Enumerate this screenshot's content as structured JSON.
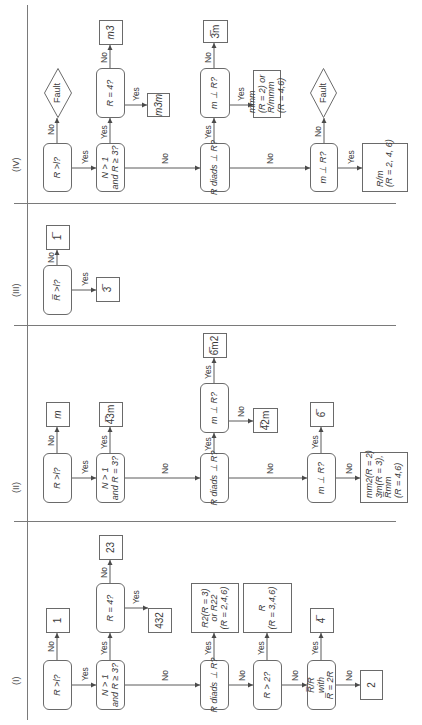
{
  "figure": {
    "sections": [
      {
        "id": "I",
        "label": "(I)",
        "u": 40,
        "v": 11
      },
      {
        "id": "II",
        "label": "(II)",
        "u": 232,
        "v": 11
      },
      {
        "id": "III",
        "label": "(III)",
        "u": 428,
        "v": 11
      },
      {
        "id": "IV",
        "label": "(IV)",
        "u": 553,
        "v": 11
      }
    ],
    "rules": [
      {
        "name": "main-flow-line",
        "u": 5,
        "v": 27,
        "w": 715,
        "h": 1
      },
      {
        "name": "divider-i-ii",
        "u": 203,
        "v": 14,
        "w": 1,
        "h": 382
      },
      {
        "name": "divider-ii-iii",
        "u": 399,
        "v": 14,
        "w": 1,
        "h": 382
      },
      {
        "name": "divider-iii-iv",
        "u": 521,
        "v": 14,
        "w": 1,
        "h": 382
      }
    ],
    "nodes": [
      {
        "id": "i_q1",
        "section": "I",
        "shape": "rounded",
        "u": 15,
        "v": 43,
        "w": 50,
        "h": 29,
        "lines": [
          "R >l?"
        ],
        "italic": true
      },
      {
        "id": "i_r1",
        "section": "I",
        "shape": "rect",
        "u": 92,
        "v": 46,
        "w": 25,
        "h": 24,
        "lines": [
          "1"
        ]
      },
      {
        "id": "i_q2",
        "section": "I",
        "shape": "rounded",
        "u": 15,
        "v": 96,
        "w": 50,
        "h": 29,
        "lines": [
          "N > 1",
          "and R ≥ 3?"
        ],
        "italic": true
      },
      {
        "id": "i_q3",
        "section": "I",
        "shape": "rounded",
        "u": 92,
        "v": 96,
        "w": 50,
        "h": 29,
        "lines": [
          "R = 4?"
        ],
        "italic": true
      },
      {
        "id": "i_r23",
        "section": "I",
        "shape": "rect",
        "u": 165,
        "v": 99,
        "w": 25,
        "h": 24,
        "lines": [
          "23"
        ]
      },
      {
        "id": "i_r432",
        "section": "I",
        "shape": "rect",
        "u": 92,
        "v": 148,
        "w": 25,
        "h": 24,
        "lines": [
          "432"
        ]
      },
      {
        "id": "i_q4",
        "section": "I",
        "shape": "rounded",
        "u": 15,
        "v": 200,
        "w": 50,
        "h": 29,
        "lines": [
          "R diads ⊥ R?"
        ],
        "italic": true
      },
      {
        "id": "i_rR2",
        "section": "I",
        "shape": "rect",
        "u": 92,
        "v": 191,
        "w": 50,
        "h": 48,
        "lines": [
          "R2(R = 3)",
          "or R22",
          "(R = 2,4,6)"
        ],
        "italic": true
      },
      {
        "id": "i_q5",
        "section": "I",
        "shape": "rounded",
        "u": 15,
        "v": 253,
        "w": 50,
        "h": 29,
        "lines": [
          "R > 2?"
        ],
        "italic": true
      },
      {
        "id": "i_rR",
        "section": "I",
        "shape": "rect",
        "u": 92,
        "v": 243,
        "w": 50,
        "h": 49,
        "lines": [
          "R",
          "(R = 3,4,6)"
        ],
        "italic": true
      },
      {
        "id": "i_q6",
        "section": "I",
        "shape": "rounded",
        "u": 15,
        "v": 307,
        "w": 50,
        "h": 29,
        "lines": [
          "R̅/R",
          "with",
          "R̅ = 2R"
        ],
        "italic": true
      },
      {
        "id": "i_r4bar",
        "section": "I",
        "shape": "rect",
        "u": 92,
        "v": 310,
        "w": 25,
        "h": 24,
        "lines": [
          "4̅"
        ]
      },
      {
        "id": "i_r2",
        "section": "I",
        "shape": "rect",
        "u": 25,
        "v": 360,
        "w": 30,
        "h": 23,
        "lines": [
          "2"
        ]
      },
      {
        "id": "ii_q1",
        "section": "II",
        "shape": "rounded",
        "u": 222,
        "v": 43,
        "w": 50,
        "h": 29,
        "lines": [
          "R >l?"
        ],
        "italic": true
      },
      {
        "id": "ii_rm",
        "section": "II",
        "shape": "rect",
        "u": 298,
        "v": 46,
        "w": 25,
        "h": 24,
        "lines": [
          "m"
        ],
        "italic": true
      },
      {
        "id": "ii_q2",
        "section": "II",
        "shape": "rounded",
        "u": 222,
        "v": 96,
        "w": 50,
        "h": 29,
        "lines": [
          "N > 1",
          "and R = 3?"
        ],
        "italic": true
      },
      {
        "id": "ii_r43m",
        "section": "II",
        "shape": "rect",
        "u": 298,
        "v": 99,
        "w": 25,
        "h": 24,
        "lines": [
          "4̅3m"
        ]
      },
      {
        "id": "ii_q3",
        "section": "II",
        "shape": "rounded",
        "u": 222,
        "v": 200,
        "w": 50,
        "h": 29,
        "lines": [
          "R diads ⊥ R?"
        ],
        "italic": true
      },
      {
        "id": "ii_q4",
        "section": "II",
        "shape": "rounded",
        "u": 292,
        "v": 200,
        "w": 50,
        "h": 29,
        "lines": [
          "m ⊥ R?"
        ],
        "italic": true
      },
      {
        "id": "ii_r6m2",
        "section": "II",
        "shape": "rect",
        "u": 367,
        "v": 203,
        "w": 25,
        "h": 24,
        "lines": [
          "6̅m2"
        ]
      },
      {
        "id": "ii_r42m",
        "section": "II",
        "shape": "rect",
        "u": 292,
        "v": 253,
        "w": 25,
        "h": 25,
        "lines": [
          "4̅2m"
        ]
      },
      {
        "id": "ii_q5",
        "section": "II",
        "shape": "rounded",
        "u": 222,
        "v": 307,
        "w": 50,
        "h": 29,
        "lines": [
          "m ⊥ R?"
        ],
        "italic": true
      },
      {
        "id": "ii_r6bar",
        "section": "II",
        "shape": "rect",
        "u": 298,
        "v": 310,
        "w": 25,
        "h": 24,
        "lines": [
          "6̅"
        ]
      },
      {
        "id": "ii_rmm2",
        "section": "II",
        "shape": "rect",
        "u": 222,
        "v": 360,
        "w": 51,
        "h": 48,
        "lines": [
          "mm2(R = 2)",
          "3m(R = 3),",
          "R̅mm",
          "(R = 4,6)"
        ],
        "italic": true,
        "align": "left"
      },
      {
        "id": "iii_q1",
        "section": "III",
        "shape": "rounded",
        "u": 410,
        "v": 43,
        "w": 50,
        "h": 29,
        "lines": [
          "R̅ >l?"
        ],
        "italic": true
      },
      {
        "id": "iii_r1bar",
        "section": "III",
        "shape": "rect",
        "u": 475,
        "v": 46,
        "w": 25,
        "h": 24,
        "lines": [
          "1̅"
        ]
      },
      {
        "id": "iii_r3bar",
        "section": "III",
        "shape": "rect",
        "u": 423,
        "v": 96,
        "w": 25,
        "h": 24,
        "lines": [
          "3̅"
        ]
      },
      {
        "id": "iv_q1",
        "section": "IV",
        "shape": "rounded",
        "u": 533,
        "v": 43,
        "w": 49,
        "h": 29,
        "lines": [
          "R >l?"
        ],
        "italic": true
      },
      {
        "id": "iv_fault1",
        "section": "IV",
        "shape": "diamond",
        "u": 607,
        "v": 44,
        "w": 50,
        "h": 28,
        "lines": [
          "Fault"
        ]
      },
      {
        "id": "iv_q2",
        "section": "IV",
        "shape": "rounded",
        "u": 533,
        "v": 96,
        "w": 49,
        "h": 29,
        "lines": [
          "N > 1",
          "and R ≥ 3?"
        ],
        "italic": true
      },
      {
        "id": "iv_q3",
        "section": "IV",
        "shape": "rounded",
        "u": 607,
        "v": 96,
        "w": 50,
        "h": 29,
        "lines": [
          "R = 4?"
        ],
        "italic": true
      },
      {
        "id": "iv_rm3",
        "section": "IV",
        "shape": "rect",
        "u": 680,
        "v": 99,
        "w": 25,
        "h": 24,
        "lines": [
          "m3"
        ],
        "italic": true
      },
      {
        "id": "iv_rm3m",
        "section": "IV",
        "shape": "rect",
        "u": 608,
        "v": 147,
        "w": 24,
        "h": 23,
        "lines": [
          "m3m"
        ],
        "italic": true
      },
      {
        "id": "iv_q4",
        "section": "IV",
        "shape": "rounded",
        "u": 533,
        "v": 200,
        "w": 49,
        "h": 30,
        "lines": [
          "R diads ⊥ R?"
        ],
        "italic": true
      },
      {
        "id": "iv_q5",
        "section": "IV",
        "shape": "rounded",
        "u": 607,
        "v": 200,
        "w": 50,
        "h": 30,
        "lines": [
          "m ⊥ R?"
        ],
        "italic": true
      },
      {
        "id": "iv_r3barm",
        "section": "IV",
        "shape": "rect",
        "u": 682,
        "v": 203,
        "w": 23,
        "h": 25,
        "lines": [
          "3̅m"
        ]
      },
      {
        "id": "iv_rmmm",
        "section": "IV",
        "shape": "rect",
        "u": 607,
        "v": 253,
        "w": 48,
        "h": 28,
        "lines": [
          "mmm",
          "(R = 2) or",
          "R/mmm",
          "(R = 4,6)"
        ],
        "italic": true,
        "align": "left"
      },
      {
        "id": "iv_q6",
        "section": "IV",
        "shape": "rounded",
        "u": 533,
        "v": 310,
        "w": 49,
        "h": 28,
        "lines": [
          "m ⊥ R?"
        ],
        "italic": true
      },
      {
        "id": "iv_fault2",
        "section": "IV",
        "shape": "diamond",
        "u": 607,
        "v": 310,
        "w": 50,
        "h": 27,
        "lines": [
          "Fault"
        ]
      },
      {
        "id": "iv_rRm",
        "section": "IV",
        "shape": "rect",
        "u": 533,
        "v": 362,
        "w": 49,
        "h": 46,
        "lines": [
          "R/m",
          "(R = 2, 4, 6)"
        ],
        "italic": true,
        "align": "left"
      }
    ],
    "edges": [
      {
        "section": "I",
        "from": [
          65,
          57
        ],
        "to": [
          92,
          57
        ],
        "label": "No",
        "lu": 73,
        "lv": 46
      },
      {
        "section": "I",
        "from": [
          40,
          72
        ],
        "to": [
          40,
          96
        ],
        "label": "Yes",
        "lu": 44,
        "lv": 80
      },
      {
        "section": "I",
        "from": [
          65,
          110
        ],
        "to": [
          92,
          110
        ],
        "label": "Yes",
        "lu": 70,
        "lv": 99
      },
      {
        "section": "I",
        "from": [
          142,
          110
        ],
        "to": [
          165,
          110
        ],
        "label": "No",
        "lu": 147,
        "lv": 99
      },
      {
        "section": "I",
        "from": [
          117,
          125
        ],
        "to": [
          117,
          148
        ],
        "label": "Yes",
        "lu": 121,
        "lv": 131
      },
      {
        "section": "I",
        "from": [
          40,
          125
        ],
        "to": [
          40,
          200
        ],
        "label": "No",
        "lu": 44,
        "lv": 160
      },
      {
        "section": "I",
        "from": [
          65,
          214
        ],
        "to": [
          92,
          214
        ],
        "label": "Yes",
        "lu": 70,
        "lv": 203
      },
      {
        "section": "I",
        "from": [
          40,
          229
        ],
        "to": [
          40,
          253
        ],
        "label": "No",
        "lu": 44,
        "lv": 237
      },
      {
        "section": "I",
        "from": [
          65,
          267
        ],
        "to": [
          92,
          267
        ],
        "label": "Yes",
        "lu": 70,
        "lv": 256
      },
      {
        "section": "I",
        "from": [
          40,
          282
        ],
        "to": [
          40,
          307
        ],
        "label": "No",
        "lu": 44,
        "lv": 290
      },
      {
        "section": "I",
        "from": [
          65,
          321
        ],
        "to": [
          92,
          321
        ],
        "label": "Yes",
        "lu": 70,
        "lv": 310
      },
      {
        "section": "I",
        "from": [
          40,
          336
        ],
        "to": [
          40,
          360
        ],
        "label": "No",
        "lu": 44,
        "lv": 344
      },
      {
        "section": "II",
        "from": [
          272,
          57
        ],
        "to": [
          298,
          57
        ],
        "label": "No",
        "lu": 279,
        "lv": 46
      },
      {
        "section": "II",
        "from": [
          247,
          72
        ],
        "to": [
          247,
          96
        ],
        "label": "Yes",
        "lu": 251,
        "lv": 80
      },
      {
        "section": "II",
        "from": [
          272,
          110
        ],
        "to": [
          298,
          110
        ],
        "label": "Yes",
        "lu": 276,
        "lv": 99
      },
      {
        "section": "II",
        "from": [
          247,
          125
        ],
        "to": [
          247,
          200
        ],
        "label": "No",
        "lu": 251,
        "lv": 160
      },
      {
        "section": "II",
        "from": [
          272,
          214
        ],
        "to": [
          292,
          214
        ],
        "label": "Yes",
        "lu": 274,
        "lv": 203
      },
      {
        "section": "II",
        "from": [
          342,
          214
        ],
        "to": [
          367,
          214
        ],
        "label": "Yes",
        "lu": 346,
        "lv": 203
      },
      {
        "section": "II",
        "from": [
          304,
          229
        ],
        "to": [
          304,
          253
        ],
        "label": "No",
        "lu": 308,
        "lv": 236
      },
      {
        "section": "II",
        "from": [
          247,
          229
        ],
        "to": [
          247,
          307
        ],
        "label": "No",
        "lu": 251,
        "lv": 265
      },
      {
        "section": "II",
        "from": [
          272,
          321
        ],
        "to": [
          298,
          321
        ],
        "label": "Yes",
        "lu": 276,
        "lv": 310
      },
      {
        "section": "II",
        "from": [
          247,
          336
        ],
        "to": [
          247,
          360
        ],
        "label": "No",
        "lu": 251,
        "lv": 344
      },
      {
        "section": "III",
        "from": [
          435,
          57
        ],
        "to": [
          475,
          57
        ],
        "label": "No",
        "lu": 462,
        "lv": 46
      },
      {
        "section": "III",
        "from": [
          435,
          72
        ],
        "to": [
          435,
          96
        ],
        "label": "Yes",
        "lu": 439,
        "lv": 80
      },
      {
        "section": "IV",
        "from": [
          557,
          57
        ],
        "to": [
          607,
          57
        ],
        "label": "No",
        "lu": 590,
        "lv": 46
      },
      {
        "section": "IV",
        "from": [
          557,
          72
        ],
        "to": [
          557,
          96
        ],
        "label": "Yes",
        "lu": 561,
        "lv": 80
      },
      {
        "section": "IV",
        "from": [
          582,
          110
        ],
        "to": [
          607,
          110
        ],
        "label": "Yes",
        "lu": 586,
        "lv": 99
      },
      {
        "section": "IV",
        "from": [
          657,
          110
        ],
        "to": [
          680,
          110
        ],
        "label": "No",
        "lu": 662,
        "lv": 99
      },
      {
        "section": "IV",
        "from": [
          620,
          125
        ],
        "to": [
          620,
          147
        ],
        "label": "Yes",
        "lu": 624,
        "lv": 131
      },
      {
        "section": "IV",
        "from": [
          557,
          125
        ],
        "to": [
          557,
          200
        ],
        "label": "No",
        "lu": 561,
        "lv": 160
      },
      {
        "section": "IV",
        "from": [
          582,
          214
        ],
        "to": [
          607,
          214
        ],
        "label": "Yes",
        "lu": 586,
        "lv": 203
      },
      {
        "section": "IV",
        "from": [
          657,
          214
        ],
        "to": [
          682,
          214
        ],
        "label": "No",
        "lu": 662,
        "lv": 203
      },
      {
        "section": "IV",
        "from": [
          620,
          230
        ],
        "to": [
          620,
          253
        ],
        "label": "Yes",
        "lu": 624,
        "lv": 236
      },
      {
        "section": "IV",
        "from": [
          557,
          230
        ],
        "to": [
          557,
          310
        ],
        "label": "No",
        "lu": 561,
        "lv": 265
      },
      {
        "section": "IV",
        "from": [
          582,
          324
        ],
        "to": [
          607,
          324
        ],
        "label": "No",
        "lu": 588,
        "lv": 313
      },
      {
        "section": "IV",
        "from": [
          557,
          338
        ],
        "to": [
          557,
          362
        ],
        "label": "Yes",
        "lu": 561,
        "lv": 346
      }
    ]
  }
}
